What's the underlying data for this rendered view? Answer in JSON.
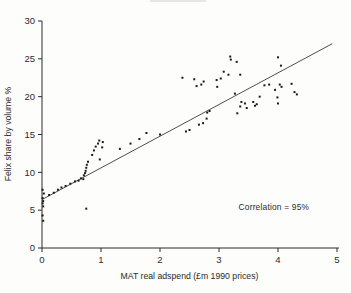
{
  "figure": {
    "background_color": "#fdfdfc",
    "artifact_color": "#e6e6e6"
  },
  "chart_data": {
    "type": "scatter",
    "title": "",
    "xlabel": "MAT real adspend (£m 1990 prices)",
    "ylabel": "Felix share by volume %",
    "xlim": [
      0,
      5
    ],
    "ylim": [
      0,
      30
    ],
    "xticks": [
      0,
      1,
      2,
      3,
      4,
      5
    ],
    "yticks": [
      0,
      5,
      10,
      15,
      20,
      25,
      30
    ],
    "grid": false,
    "legend": "none",
    "annotation": {
      "text": "Correlation = 95%",
      "x": 3.93,
      "y": 5.0
    },
    "trendline": {
      "x1": 0.0,
      "y1": 6.4,
      "x2": 4.92,
      "y2": 27.0
    },
    "axis_color": "#2b2b2b",
    "line_color": "#3a3a3a",
    "point_color": "#1a1a1a",
    "points": [
      [
        0.01,
        7.7
      ],
      [
        0.03,
        7.2
      ],
      [
        0.01,
        6.6
      ],
      [
        0.02,
        6.2
      ],
      [
        0.01,
        5.9
      ],
      [
        0.02,
        5.5
      ],
      [
        0.01,
        4.3
      ],
      [
        0.02,
        3.6
      ],
      [
        0.12,
        7.0
      ],
      [
        0.2,
        7.3
      ],
      [
        0.27,
        7.7
      ],
      [
        0.33,
        8.0
      ],
      [
        0.4,
        8.2
      ],
      [
        0.48,
        8.5
      ],
      [
        0.56,
        8.8
      ],
      [
        0.62,
        8.9
      ],
      [
        0.66,
        9.2
      ],
      [
        0.7,
        9.1
      ],
      [
        0.71,
        9.6
      ],
      [
        0.73,
        9.9
      ],
      [
        0.74,
        10.2
      ],
      [
        0.75,
        10.6
      ],
      [
        0.76,
        11.0
      ],
      [
        0.78,
        11.4
      ],
      [
        0.75,
        5.2
      ],
      [
        0.85,
        12.3
      ],
      [
        0.88,
        12.9
      ],
      [
        0.91,
        13.4
      ],
      [
        0.95,
        13.8
      ],
      [
        0.97,
        14.2
      ],
      [
        0.98,
        11.7
      ],
      [
        1.02,
        13.3
      ],
      [
        1.03,
        14.0
      ],
      [
        1.32,
        13.1
      ],
      [
        1.5,
        13.8
      ],
      [
        1.65,
        14.4
      ],
      [
        1.77,
        15.2
      ],
      [
        2.0,
        15.0
      ],
      [
        2.38,
        22.5
      ],
      [
        2.44,
        15.4
      ],
      [
        2.5,
        15.6
      ],
      [
        2.58,
        22.3
      ],
      [
        2.62,
        21.4
      ],
      [
        2.66,
        16.3
      ],
      [
        2.7,
        21.6
      ],
      [
        2.73,
        16.5
      ],
      [
        2.74,
        22.0
      ],
      [
        2.79,
        17.1
      ],
      [
        2.8,
        17.9
      ],
      [
        2.84,
        18.1
      ],
      [
        2.96,
        22.2
      ],
      [
        2.97,
        21.3
      ],
      [
        3.03,
        22.4
      ],
      [
        3.08,
        23.3
      ],
      [
        3.16,
        22.9
      ],
      [
        3.19,
        25.3
      ],
      [
        3.2,
        24.9
      ],
      [
        3.27,
        20.4
      ],
      [
        3.3,
        24.6
      ],
      [
        3.31,
        17.8
      ],
      [
        3.36,
        22.9
      ],
      [
        3.36,
        18.7
      ],
      [
        3.38,
        19.3
      ],
      [
        3.44,
        19.1
      ],
      [
        3.47,
        18.5
      ],
      [
        3.58,
        19.3
      ],
      [
        3.61,
        18.8
      ],
      [
        3.64,
        19.0
      ],
      [
        3.69,
        20.0
      ],
      [
        3.77,
        21.5
      ],
      [
        3.85,
        21.6
      ],
      [
        3.95,
        20.9
      ],
      [
        3.99,
        19.9
      ],
      [
        4.0,
        25.2
      ],
      [
        4.0,
        19.1
      ],
      [
        4.03,
        21.6
      ],
      [
        4.05,
        24.1
      ],
      [
        4.06,
        21.3
      ],
      [
        4.23,
        21.7
      ],
      [
        4.28,
        20.6
      ],
      [
        4.32,
        20.3
      ]
    ]
  }
}
